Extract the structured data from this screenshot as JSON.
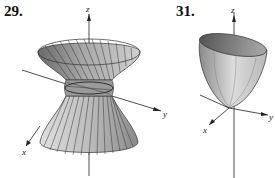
{
  "figures": [
    {
      "number": "29.",
      "surface": "hyperboloid of one sheet",
      "axes": {
        "z": "z",
        "x": "x",
        "y": "y"
      }
    },
    {
      "number": "31.",
      "surface": "elliptic paraboloid",
      "axes": {
        "z": "z",
        "x": "x",
        "y": "y"
      }
    }
  ],
  "colors": {
    "surface_dark": "#555555",
    "surface_light": "#d8d8d8",
    "axis": "#222222",
    "background": "#ffffff"
  }
}
